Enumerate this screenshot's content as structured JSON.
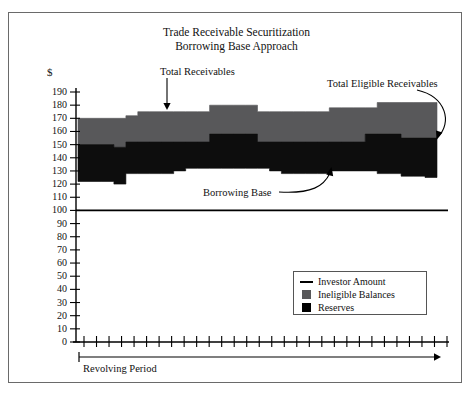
{
  "title": {
    "line1": "Trade Receivable Securitization",
    "line2": "Borrowing Base Approach"
  },
  "axis": {
    "y_unit_label": "$",
    "y_ticks": [
      190,
      180,
      170,
      160,
      150,
      140,
      130,
      120,
      110,
      100,
      90,
      80,
      70,
      60,
      50,
      40,
      30,
      20,
      10,
      0
    ],
    "x_tick_count": 30,
    "x_axis_caption": "Revolving Period"
  },
  "annotations": {
    "total_receivables": "Total Receivables",
    "total_eligible_receivables": "Total Eligible Receivables",
    "borrowing_base": "Borrowing Base"
  },
  "legend": {
    "items": [
      {
        "label": "Investor Amount",
        "key": "line",
        "color": "#000000"
      },
      {
        "label": "Ineligible Balances",
        "key": "square",
        "color": "#58585a"
      },
      {
        "label": "Reserves",
        "key": "square",
        "color": "#000000"
      }
    ]
  },
  "colors": {
    "ineligible": "#58585a",
    "reserves": "#0d0d0d",
    "investor_line": "#000000",
    "frame": "#6a6a6a"
  },
  "chart_data": {
    "type": "area",
    "title": "Trade Receivable Securitization Borrowing Base Approach",
    "xlabel": "Revolving Period",
    "ylabel": "$",
    "ylim": [
      0,
      190
    ],
    "grid": false,
    "legend_position": "bottom-right",
    "x": [
      0,
      1,
      2,
      3,
      4,
      5,
      6,
      7,
      8,
      9,
      10,
      11,
      12,
      13,
      14,
      15,
      16,
      17,
      18,
      19,
      20,
      21,
      22,
      23,
      24,
      25,
      26,
      27,
      28,
      29,
      30
    ],
    "series": [
      {
        "name": "Total Receivables",
        "note": "top of stacked area (upper boundary of Ineligible Balances)",
        "values": [
          170,
          170,
          170,
          170,
          172,
          175,
          175,
          175,
          175,
          175,
          175,
          180,
          180,
          180,
          180,
          175,
          175,
          175,
          175,
          175,
          175,
          178,
          178,
          178,
          178,
          182,
          182,
          182,
          182,
          182,
          182
        ]
      },
      {
        "name": "Total Eligible Receivables",
        "note": "boundary between Ineligible Balances and Reserves",
        "values": [
          150,
          150,
          150,
          148,
          152,
          152,
          152,
          152,
          152,
          152,
          152,
          158,
          158,
          158,
          158,
          152,
          152,
          152,
          152,
          152,
          152,
          152,
          152,
          152,
          158,
          158,
          158,
          155,
          155,
          155,
          155
        ]
      },
      {
        "name": "Borrowing Base",
        "note": "bottom of Reserves band",
        "values": [
          122,
          122,
          122,
          120,
          128,
          128,
          128,
          128,
          130,
          132,
          132,
          132,
          132,
          132,
          132,
          132,
          130,
          128,
          128,
          128,
          128,
          130,
          130,
          130,
          130,
          128,
          128,
          126,
          126,
          125,
          125
        ]
      },
      {
        "name": "Investor Amount",
        "note": "flat horizontal line",
        "values": [
          100,
          100,
          100,
          100,
          100,
          100,
          100,
          100,
          100,
          100,
          100,
          100,
          100,
          100,
          100,
          100,
          100,
          100,
          100,
          100,
          100,
          100,
          100,
          100,
          100,
          100,
          100,
          100,
          100,
          100,
          100
        ]
      }
    ]
  }
}
